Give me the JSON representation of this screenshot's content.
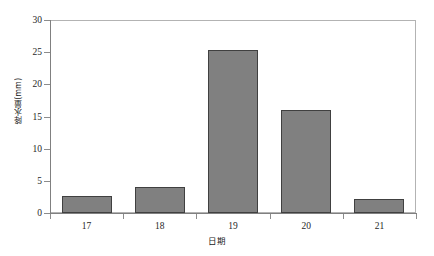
{
  "chart_data": {
    "type": "bar",
    "title": "",
    "xlabel": "日期",
    "ylabel": "降水量(mm)",
    "categories": [
      "17",
      "18",
      "19",
      "20",
      "21"
    ],
    "values": [
      2.7,
      4.0,
      25.4,
      16.0,
      2.2
    ],
    "ylim": [
      0,
      30
    ],
    "yticks": [
      "0",
      "5",
      "10",
      "15",
      "20",
      "25",
      "30"
    ],
    "ytick_values": [
      0,
      5,
      10,
      15,
      20,
      25,
      30
    ],
    "grid": false,
    "legend": "none",
    "bar_color": "#808080",
    "bar_border_color": "#404040",
    "axis_color": "#808080",
    "frame_color": "#b3b3b3",
    "text_color": "#1f1f1f"
  }
}
